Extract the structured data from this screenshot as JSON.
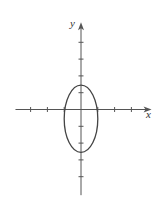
{
  "figure": {
    "type": "ellipse-on-axes",
    "x_axis_label": "x",
    "y_axis_label": "y",
    "colors": {
      "axis": "#555555",
      "curve": "#444444",
      "background": "#ffffff"
    }
  },
  "geometry": {
    "origin_px": [
      81,
      109.5
    ],
    "unit_px": 16.8,
    "x_axis_range_units": [
      -3.9,
      4.2
    ],
    "y_axis_range_units": [
      -5.1,
      5.2
    ],
    "x_ticks": [
      -3,
      -2,
      -1,
      1,
      2,
      3
    ],
    "y_ticks": [
      -4,
      -3,
      -2,
      -1,
      1,
      2,
      3,
      4
    ],
    "ellipse": {
      "center": [
        0,
        -0.55
      ],
      "semi_axis_x": 1.0,
      "semi_axis_y": 2.0
    }
  }
}
